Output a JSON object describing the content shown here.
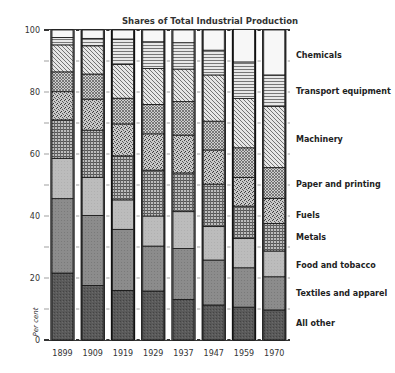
{
  "chart_data": {
    "type": "bar",
    "stacked": true,
    "title": "Shares of Total Industrial Production",
    "xlabel": "",
    "ylabel": "Per cent",
    "ylim": [
      0,
      100
    ],
    "yticks": [
      0,
      20,
      40,
      60,
      80,
      100
    ],
    "ytick_minor": [
      10,
      30,
      50,
      70,
      90
    ],
    "grid": false,
    "legend_position": "right, labels aligned with final bar",
    "categories": [
      "1899",
      "1909",
      "1919",
      "1929",
      "1937",
      "1947",
      "1959",
      "1970"
    ],
    "series": [
      {
        "name": "All other",
        "pattern": "dark",
        "values": [
          21.6,
          17.6,
          16.0,
          15.8,
          13.1,
          11.3,
          10.6,
          9.7
        ]
      },
      {
        "name": "Textiles and apparel",
        "pattern": "medium",
        "values": [
          24.0,
          22.6,
          19.7,
          14.5,
          16.4,
          14.5,
          12.7,
          10.7
        ]
      },
      {
        "name": "Food and tobacco",
        "pattern": "light",
        "values": [
          13.0,
          12.3,
          9.5,
          9.7,
          11.9,
          10.8,
          9.5,
          8.3
        ]
      },
      {
        "name": "Metals",
        "pattern": "grid",
        "values": [
          12.4,
          15.2,
          14.2,
          14.8,
          12.5,
          13.7,
          10.4,
          8.9
        ]
      },
      {
        "name": "Fuels",
        "pattern": "stipple",
        "values": [
          9.1,
          10.0,
          10.3,
          11.7,
          12.2,
          11.0,
          9.2,
          8.1
        ]
      },
      {
        "name": "Paper and printing",
        "pattern": "crosshatch",
        "values": [
          6.4,
          8.1,
          8.3,
          9.5,
          10.8,
          9.3,
          9.6,
          9.9
        ]
      },
      {
        "name": "Machinery",
        "pattern": "diagonal",
        "values": [
          8.7,
          9.1,
          10.9,
          11.6,
          10.5,
          14.9,
          15.9,
          19.7
        ]
      },
      {
        "name": "Transport equipment",
        "pattern": "horizontal",
        "values": [
          2.4,
          2.4,
          8.2,
          8.6,
          8.5,
          8.0,
          11.8,
          10.2
        ]
      },
      {
        "name": "Chemicals",
        "pattern": "white",
        "values": [
          2.4,
          2.7,
          2.9,
          3.8,
          4.1,
          6.5,
          10.5,
          14.5
        ]
      }
    ],
    "legend": [
      {
        "label": "Chemicals",
        "y": 55
      },
      {
        "label": "Transport equipment",
        "y": 91
      },
      {
        "label": "Machinery",
        "y": 139
      },
      {
        "label": "Paper and printing",
        "y": 184
      },
      {
        "label": "Fuels",
        "y": 215
      },
      {
        "label": "Metals",
        "y": 237
      },
      {
        "label": "Food and tobacco",
        "y": 265
      },
      {
        "label": "Textiles and apparel",
        "y": 293
      },
      {
        "label": "All other",
        "y": 323
      }
    ]
  }
}
